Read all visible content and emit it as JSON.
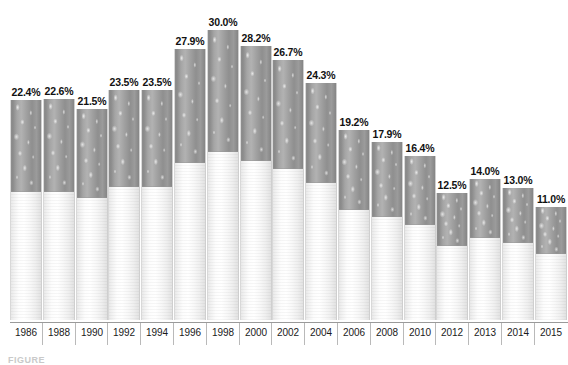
{
  "chart_data": {
    "type": "bar",
    "title": "",
    "subtitle": "",
    "xlabel": "",
    "ylabel": "",
    "ylim": [
      0,
      32
    ],
    "grid": false,
    "legend": null,
    "categories": [
      "1986",
      "1988",
      "1990",
      "1992",
      "1994",
      "1996",
      "1998",
      "2000",
      "2002",
      "2004",
      "2006",
      "2008",
      "2010",
      "2012",
      "2013",
      "2014",
      "2015"
    ],
    "values": [
      22.4,
      22.6,
      21.5,
      23.5,
      23.5,
      27.9,
      30.0,
      28.2,
      26.7,
      24.3,
      19.2,
      17.9,
      16.4,
      12.5,
      14.0,
      13.0,
      11.0
    ],
    "data_labels": [
      "22.4%",
      "22.6%",
      "21.5%",
      "23.5%",
      "23.5%",
      "27.9%",
      "30.0%",
      "28.2%",
      "26.7%",
      "24.3%",
      "19.2%",
      "17.9%",
      "16.4%",
      "12.5%",
      "14.0%",
      "13.0%",
      "11.0%"
    ],
    "bar_style": "cigarette-pictorial",
    "annotations": []
  },
  "caption": {
    "text": "FIGURE"
  },
  "colors": {
    "background": "#ffffff",
    "tobacco": "#9b9b9b",
    "paper": "#f5f5f5",
    "axis": "#9a9a9a",
    "label_text": "#111111"
  }
}
